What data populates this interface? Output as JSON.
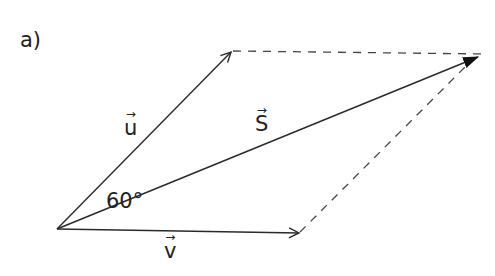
{
  "part_label": "a)",
  "vectors": {
    "u": {
      "name": "u",
      "arrow": "→"
    },
    "v": {
      "name": "v",
      "arrow": "→"
    },
    "s": {
      "name": "S",
      "arrow": "→"
    }
  },
  "angle_label": "60°",
  "colors": {
    "line": "#2a2a2a",
    "dashed": "#444444",
    "text": "#222222"
  }
}
